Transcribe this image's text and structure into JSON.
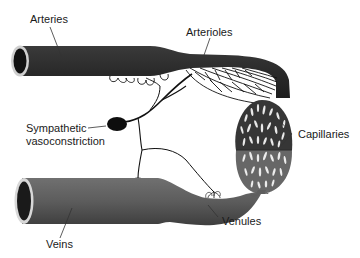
{
  "diagram": {
    "labels": {
      "arteries": "Arteries",
      "arterioles": "Arterioles",
      "sympathetic_line1": "Sympathetic",
      "sympathetic_line2": "vasoconstriction",
      "capillaries": "Capillaries",
      "venules": "Venules",
      "veins": "Veins"
    },
    "colors": {
      "artery": "#2b2b2b",
      "vein": "#5e5e5e",
      "capillary_top": "#3a3a3a",
      "capillary_bottom": "#6a6a6a",
      "nerve": "#111111",
      "background": "#ffffff"
    }
  }
}
